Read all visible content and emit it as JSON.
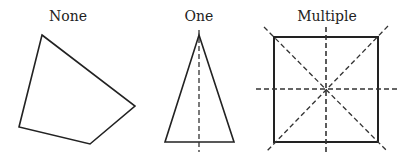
{
  "diagram": {
    "panels": [
      {
        "label": "None",
        "shape": "irregular-quadrilateral",
        "symmetry_lines": 0
      },
      {
        "label": "One",
        "shape": "isosceles-triangle",
        "symmetry_lines": 1
      },
      {
        "label": "Multiple",
        "shape": "square",
        "symmetry_lines": 4
      }
    ]
  }
}
